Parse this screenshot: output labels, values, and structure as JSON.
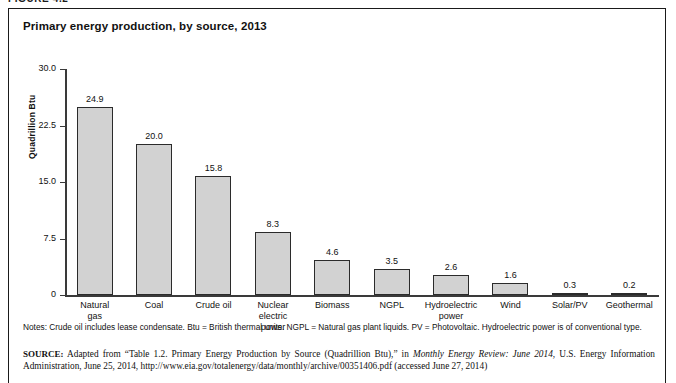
{
  "figure": {
    "label": "FIGURE 4.2"
  },
  "chart_title": "Primary energy production, by source, 2013",
  "chart_data": {
    "type": "bar",
    "title": "Primary energy production, by source, 2013",
    "xlabel": "",
    "ylabel": "Quadrillion Btu",
    "ylim": [
      0,
      30
    ],
    "yticks": [
      "0",
      "7.5",
      "15.0",
      "22.5",
      "30.0"
    ],
    "ytick_values": [
      0,
      7.5,
      15.0,
      22.5,
      30.0
    ],
    "grid": false,
    "legend": "none",
    "categories": [
      "Natural gas",
      "Coal",
      "Crude oil",
      "Nuclear electric power",
      "Biomass",
      "NGPL",
      "Hydroelectric power",
      "Wind",
      "Solar/PV",
      "Geothermal"
    ],
    "category_lines": [
      [
        "Natural",
        "gas"
      ],
      [
        "Coal"
      ],
      [
        "Crude oil"
      ],
      [
        "Nuclear electric",
        "power"
      ],
      [
        "Biomass"
      ],
      [
        "NGPL"
      ],
      [
        "Hydroelectric",
        "power"
      ],
      [
        "Wind"
      ],
      [
        "Solar/PV"
      ],
      [
        "Geothermal"
      ]
    ],
    "values": [
      24.9,
      20.0,
      15.8,
      8.3,
      4.6,
      3.5,
      2.6,
      1.6,
      0.3,
      0.2
    ],
    "value_labels": [
      "24.9",
      "20.0",
      "15.8",
      "8.3",
      "4.6",
      "3.5",
      "2.6",
      "1.6",
      "0.3",
      "0.2"
    ],
    "bar_fill": "#d2d2d2",
    "bar_stroke": "#2b2b2b"
  },
  "notes": "Notes: Crude oil includes lease condensate. Btu = British thermal units. NGPL = Natural gas plant liquids. PV = Photovoltaic. Hydroelectric power is of conventional type.",
  "source": {
    "prefix": "SOURCE:",
    "part1": " Adapted from “Table 1.2. Primary Energy Production by Source (Quadrillion Btu),” in ",
    "italic": "Monthly Energy Review: June 2014",
    "part2": ", U.S. Energy Information Administration, June 25, 2014, http://www.eia.gov/totalenergy/data/monthly/archive/00351406.pdf (accessed June 27, 2014)"
  }
}
